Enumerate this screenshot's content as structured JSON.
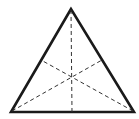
{
  "diagram": {
    "colors": {
      "stroke": "#1a1a1a",
      "median": "#333333",
      "background": "#ffffff"
    },
    "vertices": {
      "top": [
        71,
        9
      ],
      "bottom_left": [
        11,
        112
      ],
      "bottom_right": [
        134,
        112
      ]
    },
    "medians": [
      {
        "from": "top",
        "to": "base_midpoint"
      },
      {
        "from": "bottom_left",
        "to": "right_side_midpoint"
      },
      {
        "from": "bottom_right",
        "to": "left_side_midpoint"
      }
    ]
  }
}
